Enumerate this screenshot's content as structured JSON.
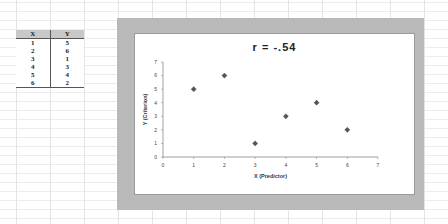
{
  "table": {
    "headers": [
      "X",
      "Y"
    ],
    "rows": [
      [
        "1",
        "5"
      ],
      [
        "2",
        "6"
      ],
      [
        "3",
        "1"
      ],
      [
        "4",
        "3"
      ],
      [
        "5",
        "4"
      ],
      [
        "6",
        "2"
      ]
    ]
  },
  "chart_data": {
    "type": "scatter",
    "title": "r  =  -.54",
    "xlabel": "X (Predictor)",
    "ylabel": "Y (Criterion)",
    "x": [
      1,
      2,
      3,
      4,
      5,
      6
    ],
    "y": [
      5,
      6,
      1,
      3,
      4,
      2
    ],
    "xlim": [
      0,
      7
    ],
    "ylim": [
      0,
      7
    ],
    "xticks": [
      0,
      1,
      2,
      3,
      4,
      5,
      6,
      7
    ],
    "yticks": [
      0,
      1,
      2,
      3,
      4,
      5,
      6,
      7
    ],
    "grid": false,
    "legend": null,
    "marker": "diamond",
    "marker_color": "#555555",
    "frame_color": "#b9b9b9"
  }
}
